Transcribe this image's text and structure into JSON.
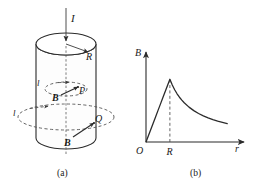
{
  "figure": {
    "panels": [
      {
        "id": "a",
        "caption": "(a)",
        "description": "Cylindrical conductor of radius R carrying current I, with circular Amperian loops through points P and Q"
      },
      {
        "id": "b",
        "caption": "(b)",
        "description": "Magnitude of magnetic field B as a function of radial distance r"
      }
    ]
  },
  "panel_a": {
    "caption": "(a)",
    "current_label": "I",
    "radius_label": "R",
    "loop_inner_label": "l",
    "loop_outer_label": "l",
    "field_inner_label": "B",
    "field_outer_label": "B",
    "point_inner_label": "P",
    "point_outer_label": "Q"
  },
  "panel_b": {
    "caption": "(b)",
    "origin_label": "O",
    "y_axis_label": "B",
    "x_axis_label": "r",
    "tick_label_R": "R"
  },
  "chart_data": {
    "type": "line",
    "title": "",
    "xlabel": "r",
    "ylabel": "B",
    "xlim": [
      0,
      3.6
    ],
    "ylim": [
      0,
      1.18
    ],
    "grid": false,
    "legend": false,
    "axis_ticks": {
      "x": [
        {
          "value": 0,
          "label": "O"
        },
        {
          "value": 1,
          "label": "R"
        }
      ],
      "y": []
    },
    "annotations": [
      {
        "type": "dashed-vline",
        "x": 1,
        "from_y": 0,
        "to_y": 1,
        "label": "R"
      }
    ],
    "series": [
      {
        "name": "B(r)",
        "x": [
          0.0,
          0.1,
          0.2,
          0.3,
          0.4,
          0.5,
          0.6,
          0.7,
          0.8,
          0.9,
          1.0,
          1.1,
          1.2,
          1.3,
          1.4,
          1.5,
          1.6,
          1.8,
          2.0,
          2.2,
          2.4,
          2.6,
          2.8,
          3.0,
          3.2,
          3.4
        ],
        "values": [
          0.0,
          0.1,
          0.2,
          0.3,
          0.4,
          0.5,
          0.6,
          0.7,
          0.8,
          0.9,
          1.0,
          0.909,
          0.833,
          0.769,
          0.714,
          0.667,
          0.625,
          0.556,
          0.5,
          0.455,
          0.417,
          0.385,
          0.357,
          0.333,
          0.313,
          0.294
        ]
      }
    ],
    "regions": [
      {
        "name": "inside-conductor",
        "x_range": [
          0,
          1
        ],
        "relation": "B proportional to r"
      },
      {
        "name": "outside-conductor",
        "x_range": [
          1,
          3.4
        ],
        "relation": "B proportional to 1/r"
      }
    ],
    "peak": {
      "x": 1,
      "y": 1,
      "label": "R"
    }
  }
}
